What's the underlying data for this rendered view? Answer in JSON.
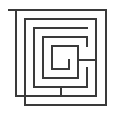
{
  "figure": {
    "kind": "maze-diagram",
    "canvas": {
      "width": 115,
      "height": 115
    },
    "background_color": "#ffffff",
    "line_color": "#3a3a3a",
    "line_width": 2,
    "margin": 8
  },
  "maze": {
    "outer_border": {
      "name": "outer-boundary",
      "x": 9,
      "y": 9,
      "width": 97,
      "height": 97,
      "gap_side": "bottom-left"
    },
    "walls": [
      {
        "id": "w01",
        "name": "outer-top",
        "points": "9,10 106,10"
      },
      {
        "id": "w02",
        "name": "outer-right",
        "points": "106,10 106,105"
      },
      {
        "id": "w03",
        "name": "outer-bottom",
        "points": "106,105 25,105"
      },
      {
        "id": "w04",
        "name": "outer-left-lower",
        "points": "25,105 25,19"
      },
      {
        "id": "w05",
        "name": "ring2-top",
        "points": "25,19 96,19"
      },
      {
        "id": "w06",
        "name": "ring2-right",
        "points": "96,19 96,96"
      },
      {
        "id": "w07",
        "name": "ring2-bottom",
        "points": "96,96 16,96"
      },
      {
        "id": "w08",
        "name": "ring2-left",
        "points": "16,96 16,10"
      },
      {
        "id": "w09",
        "name": "ring3-left",
        "points": "34,28 34,87"
      },
      {
        "id": "w10",
        "name": "ring3-bottom",
        "points": "34,87 87,87"
      },
      {
        "id": "w11",
        "name": "ring3-right-stub",
        "points": "87,87 87,68"
      },
      {
        "id": "w12",
        "name": "ring3-top",
        "points": "34,28 87,28"
      },
      {
        "id": "w13",
        "name": "ring4-left",
        "points": "43,37 43,78"
      },
      {
        "id": "w14",
        "name": "ring4-bottom",
        "points": "43,78 78,78"
      },
      {
        "id": "w15",
        "name": "ring4-right",
        "points": "78,78 78,60"
      },
      {
        "id": "w16",
        "name": "ring4-branch-right",
        "points": "78,60 96,60"
      },
      {
        "id": "w17",
        "name": "core-top",
        "points": "52,46 78,46"
      },
      {
        "id": "w18",
        "name": "core-right",
        "points": "78,46 78,60"
      },
      {
        "id": "w19",
        "name": "core-left",
        "points": "52,46 52,69"
      },
      {
        "id": "w20",
        "name": "core-bottom",
        "points": "52,69 69,69"
      },
      {
        "id": "w21",
        "name": "core-inner-right",
        "points": "69,69 69,60"
      },
      {
        "id": "w22",
        "name": "spur-upper-left",
        "points": "43,37 87,37"
      },
      {
        "id": "w23",
        "name": "spur-right-vertical",
        "points": "87,37 87,46"
      },
      {
        "id": "w24",
        "name": "tail-bottom-left",
        "points": "61,96 61,87"
      }
    ]
  }
}
